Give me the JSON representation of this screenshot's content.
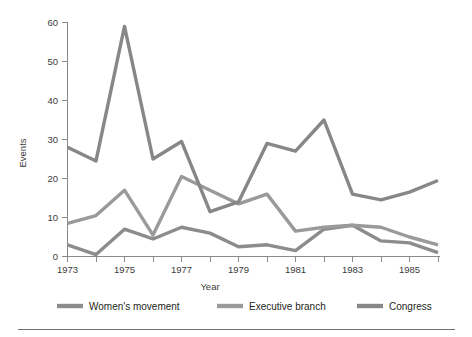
{
  "chart_data": {
    "type": "line",
    "title": "",
    "xlabel": "Year",
    "ylabel": "Events",
    "xlim": [
      1973,
      1986
    ],
    "ylim": [
      0,
      60
    ],
    "yticks": [
      0,
      10,
      20,
      30,
      40,
      50,
      60
    ],
    "xticks": [
      1973,
      1974,
      1975,
      1976,
      1977,
      1978,
      1979,
      1980,
      1981,
      1982,
      1983,
      1984,
      1985,
      1986
    ],
    "xtick_labels_shown": [
      "1973",
      "1975",
      "1977",
      "1979",
      "1981",
      "1983",
      "1985"
    ],
    "grid": false,
    "legend_position": "bottom",
    "x": [
      1973,
      1974,
      1975,
      1976,
      1977,
      1978,
      1979,
      1980,
      1981,
      1982,
      1983,
      1984,
      1985,
      1986
    ],
    "series": [
      {
        "name": "Women's movement",
        "color": "#8c8c8c",
        "values": [
          3,
          0.5,
          7,
          4.5,
          7.5,
          6,
          2.5,
          3,
          1.5,
          7,
          8,
          4,
          3.5,
          1
        ]
      },
      {
        "name": "Executive branch",
        "color": "#9a9a9a",
        "values": [
          8.5,
          10.5,
          17,
          5.5,
          20.5,
          17,
          13.5,
          16,
          6.5,
          7.5,
          8,
          7.5,
          5,
          3
        ]
      },
      {
        "name": "Congress",
        "color": "#878787",
        "values": [
          28,
          24.5,
          59,
          25,
          29.5,
          11.5,
          14,
          29,
          27,
          35,
          16,
          14.5,
          16.5,
          19.5
        ]
      }
    ]
  },
  "axes": {
    "y_title": "Events",
    "x_title": "Year",
    "y_tick_labels": [
      "0",
      "10",
      "20",
      "30",
      "40",
      "50",
      "60"
    ],
    "x_tick_labels": [
      "1973",
      "1975",
      "1977",
      "1979",
      "1981",
      "1983",
      "1985"
    ]
  },
  "legend": {
    "items": [
      {
        "label": "Women's movement",
        "color": "#8c8c8c"
      },
      {
        "label": "Executive branch",
        "color": "#9a9a9a"
      },
      {
        "label": "Congress",
        "color": "#878787"
      }
    ]
  }
}
